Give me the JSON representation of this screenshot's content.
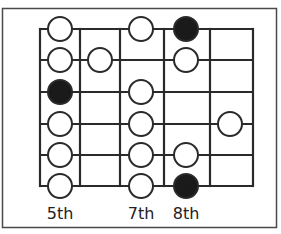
{
  "diagram": {
    "title": "",
    "type": "guitar-scale-fretboard",
    "colors": {
      "line": "#2a2a2a",
      "border": "#4a4a4a",
      "open_dot_fill": "#ffffff",
      "root_dot_fill": "#1a1a1a",
      "background": "#ffffff"
    },
    "grid": {
      "strings": 6,
      "fret_lines_x": [
        40,
        80,
        120,
        164,
        210,
        253
      ],
      "string_lines_y": [
        29,
        60,
        92,
        124,
        155,
        186
      ],
      "column_centers_x": [
        60,
        100,
        141,
        186,
        230
      ]
    },
    "fret_labels": [
      {
        "text": "5th",
        "column": 0
      },
      {
        "text": "7th",
        "column": 2
      },
      {
        "text": "8th",
        "column": 3
      }
    ],
    "dots": [
      {
        "string": 0,
        "column": 0,
        "type": "open"
      },
      {
        "string": 0,
        "column": 2,
        "type": "open"
      },
      {
        "string": 0,
        "column": 3,
        "type": "root"
      },
      {
        "string": 1,
        "column": 0,
        "type": "open"
      },
      {
        "string": 1,
        "column": 1,
        "type": "open"
      },
      {
        "string": 1,
        "column": 3,
        "type": "open"
      },
      {
        "string": 2,
        "column": 0,
        "type": "root"
      },
      {
        "string": 2,
        "column": 2,
        "type": "open"
      },
      {
        "string": 3,
        "column": 0,
        "type": "open"
      },
      {
        "string": 3,
        "column": 2,
        "type": "open"
      },
      {
        "string": 3,
        "column": 4,
        "type": "open"
      },
      {
        "string": 4,
        "column": 0,
        "type": "open"
      },
      {
        "string": 4,
        "column": 2,
        "type": "open"
      },
      {
        "string": 4,
        "column": 3,
        "type": "open"
      },
      {
        "string": 5,
        "column": 0,
        "type": "open"
      },
      {
        "string": 5,
        "column": 2,
        "type": "open"
      },
      {
        "string": 5,
        "column": 3,
        "type": "root"
      }
    ]
  }
}
